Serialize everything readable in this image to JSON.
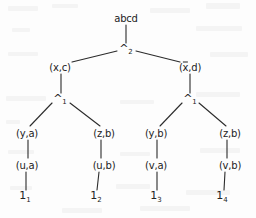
{
  "diagram": {
    "type": "binary-tree",
    "title": "abcd",
    "nodes": [
      {
        "id": "root",
        "label": "abcd",
        "x": 126,
        "y": 18,
        "kind": "root"
      },
      {
        "id": "op2",
        "label": "^",
        "sub": "2",
        "x": 126,
        "y": 50,
        "kind": "operator"
      },
      {
        "id": "l1",
        "label": "(x,c)",
        "x": 60,
        "y": 67,
        "kind": "pair"
      },
      {
        "id": "r1",
        "label": "(x,d)",
        "overline": "x",
        "x": 190,
        "y": 67,
        "kind": "pair"
      },
      {
        "id": "opL",
        "label": "^",
        "sub": "1",
        "x": 60,
        "y": 100,
        "kind": "operator"
      },
      {
        "id": "opR",
        "label": "^",
        "sub": "1",
        "x": 190,
        "y": 100,
        "kind": "operator"
      },
      {
        "id": "n1",
        "label": "(y,a)",
        "x": 27,
        "y": 133,
        "kind": "pair"
      },
      {
        "id": "n2",
        "label": "(z,b)",
        "x": 104,
        "y": 133,
        "kind": "pair"
      },
      {
        "id": "n3",
        "label": "(y,b)",
        "x": 156,
        "y": 133,
        "kind": "pair"
      },
      {
        "id": "n4",
        "label": "(z,b)",
        "x": 230,
        "y": 133,
        "kind": "pair"
      },
      {
        "id": "m1",
        "label": "(u,a)",
        "x": 27,
        "y": 165,
        "kind": "pair"
      },
      {
        "id": "m2",
        "label": "(u,b)",
        "x": 104,
        "y": 165,
        "kind": "pair"
      },
      {
        "id": "m3",
        "label": "(v,a)",
        "x": 156,
        "y": 165,
        "kind": "pair"
      },
      {
        "id": "m4",
        "label": "(v,b)",
        "x": 230,
        "y": 165,
        "kind": "pair"
      },
      {
        "id": "f1",
        "label": "1",
        "sub": "1",
        "x": 25,
        "y": 198,
        "kind": "leaf"
      },
      {
        "id": "f2",
        "label": "1",
        "sub": "2",
        "x": 96,
        "y": 198,
        "kind": "leaf"
      },
      {
        "id": "f3",
        "label": "1",
        "sub": "3",
        "x": 156,
        "y": 198,
        "kind": "leaf"
      },
      {
        "id": "f4",
        "label": "1",
        "sub": "4",
        "x": 222,
        "y": 198,
        "kind": "leaf"
      }
    ],
    "edges": [
      {
        "from": "root",
        "to": "op2",
        "x1": 126,
        "y1": 25,
        "x2": 126,
        "y2": 43
      },
      {
        "from": "op2",
        "to": "l1",
        "x1": 117,
        "y1": 51,
        "x2": 72,
        "y2": 62
      },
      {
        "from": "op2",
        "to": "r1",
        "x1": 136,
        "y1": 51,
        "x2": 180,
        "y2": 62
      },
      {
        "from": "l1",
        "to": "opL",
        "x1": 61,
        "y1": 74,
        "x2": 61,
        "y2": 93
      },
      {
        "from": "r1",
        "to": "opR",
        "x1": 190,
        "y1": 74,
        "x2": 190,
        "y2": 93
      },
      {
        "from": "opL",
        "to": "n1",
        "x1": 52,
        "y1": 103,
        "x2": 30,
        "y2": 126
      },
      {
        "from": "opL",
        "to": "n2",
        "x1": 70,
        "y1": 103,
        "x2": 100,
        "y2": 126
      },
      {
        "from": "opR",
        "to": "n3",
        "x1": 182,
        "y1": 103,
        "x2": 160,
        "y2": 126
      },
      {
        "from": "opR",
        "to": "n4",
        "x1": 199,
        "y1": 103,
        "x2": 226,
        "y2": 126
      },
      {
        "from": "n1",
        "to": "m1",
        "x1": 28,
        "y1": 140,
        "x2": 28,
        "y2": 158
      },
      {
        "from": "n2",
        "to": "m2",
        "x1": 101,
        "y1": 140,
        "x2": 101,
        "y2": 158
      },
      {
        "from": "n3",
        "to": "m3",
        "x1": 157,
        "y1": 140,
        "x2": 157,
        "y2": 158
      },
      {
        "from": "n4",
        "to": "m4",
        "x1": 227,
        "y1": 140,
        "x2": 227,
        "y2": 158
      },
      {
        "from": "m1",
        "to": "f1",
        "x1": 26,
        "y1": 172,
        "x2": 26,
        "y2": 190
      },
      {
        "from": "m2",
        "to": "f2",
        "x1": 99,
        "y1": 172,
        "x2": 97,
        "y2": 190
      },
      {
        "from": "m3",
        "to": "f3",
        "x1": 157,
        "y1": 172,
        "x2": 157,
        "y2": 190
      },
      {
        "from": "m4",
        "to": "f4",
        "x1": 225,
        "y1": 172,
        "x2": 224,
        "y2": 190
      }
    ],
    "stroke_color": "#2b2b2b",
    "background_color": "#fdfdfd"
  }
}
